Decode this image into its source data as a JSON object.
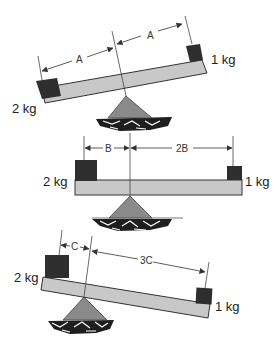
{
  "diagram": {
    "type": "lever-balance-illustration",
    "colors": {
      "beam_fill": "#c8c8c8",
      "beam_stroke": "#333333",
      "weight_fill": "#2e2e2e",
      "fulcrum_fill": "#8a8a8a",
      "rock_fill": "#1e1e1e",
      "line": "#444444"
    },
    "panels": [
      {
        "id": "top",
        "state": "tilted (right side up)",
        "left_mass": "2 kg",
        "right_mass": "1 kg",
        "left_distance_label": "A",
        "right_distance_label": "A"
      },
      {
        "id": "middle",
        "state": "balanced",
        "left_mass": "2 kg",
        "right_mass": "1 kg",
        "left_distance_label": "B",
        "right_distance_label": "2B"
      },
      {
        "id": "bottom",
        "state": "tilted (right side down)",
        "left_mass": "2 kg",
        "right_mass": "1 kg",
        "left_distance_label": "C",
        "right_distance_label": "3C"
      }
    ]
  }
}
